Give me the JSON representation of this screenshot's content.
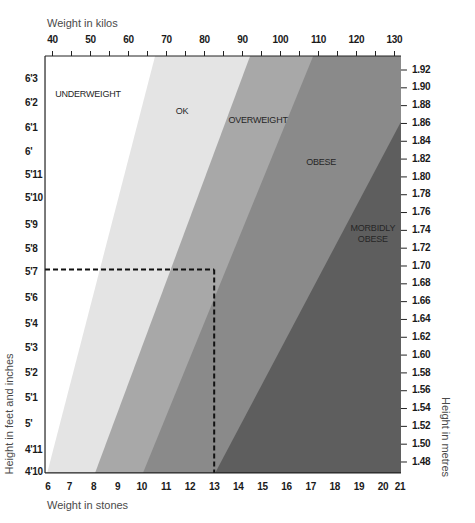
{
  "chart_data": {
    "type": "area",
    "title": "",
    "subtitle": "",
    "grid": false,
    "legend": "none (zone names printed inside the regions)",
    "x_top": {
      "label": "Weight in kilos",
      "unit": "kg",
      "ticks": [
        40,
        50,
        60,
        70,
        80,
        90,
        100,
        110,
        120,
        130
      ],
      "minor_ticks": [
        45,
        55,
        65,
        75,
        85,
        95,
        105,
        115,
        125
      ]
    },
    "x_bottom": {
      "label": "Weight in stones",
      "unit": "st",
      "ticks": [
        6,
        7,
        8,
        9,
        10,
        11,
        12,
        13,
        14,
        15,
        16,
        17,
        18,
        19,
        20,
        21
      ],
      "kg_per_stone": 6.35
    },
    "y_left": {
      "label": "Height in feet and inches",
      "ticks": [
        {
          "label": "6'3",
          "m": 1.91
        },
        {
          "label": "6'2",
          "m": 1.883
        },
        {
          "label": "6'1",
          "m": 1.855
        },
        {
          "label": "6'",
          "m": 1.828
        },
        {
          "label": "5'11",
          "m": 1.802
        },
        {
          "label": "5'10",
          "m": 1.776
        },
        {
          "label": "5'9",
          "m": 1.746
        },
        {
          "label": "5'8",
          "m": 1.719
        },
        {
          "label": "5'7",
          "m": 1.693
        },
        {
          "label": "5'6",
          "m": 1.664
        },
        {
          "label": "5'4",
          "m": 1.635
        },
        {
          "label": "5'3",
          "m": 1.607
        },
        {
          "label": "5'2",
          "m": 1.58
        },
        {
          "label": "5'1",
          "m": 1.551
        },
        {
          "label": "5'",
          "m": 1.522
        },
        {
          "label": "4'11",
          "m": 1.493
        },
        {
          "label": "4'10",
          "m": 1.468
        }
      ]
    },
    "y_right": {
      "label": "Height in metres",
      "unit": "m",
      "ticks": [
        "1.92",
        "1.90",
        "1.88",
        "1.86",
        "1.84",
        "1.82",
        "1.80",
        "1.78",
        "1.76",
        "1.74",
        "1.72",
        "1.70",
        "1.68",
        "1.66",
        "1.64",
        "1.62",
        "1.60",
        "1.58",
        "1.56",
        "1.54",
        "1.52",
        "1.50",
        "1.48"
      ]
    },
    "xlim_kg": [
      38.03,
      131.7
    ],
    "ylim_m": [
      1.4677,
      1.9357
    ],
    "zones": [
      {
        "name": "UNDERWEIGHT",
        "label_lines": [
          "UNDERWEIGHT"
        ],
        "color": "#ffffff",
        "label_kg": 40.7,
        "label_m": 1.892,
        "anchor": "start"
      },
      {
        "name": "OK",
        "label_lines": [
          "OK"
        ],
        "color": "#e4e4e4",
        "boundary_left": [
          [
            38.6,
            1.4677
          ],
          [
            67.0,
            1.9357
          ]
        ],
        "label_kg": 74.1,
        "label_m": 1.873,
        "anchor": "middle"
      },
      {
        "name": "OVERWEIGHT",
        "label_lines": [
          "OVERWEIGHT"
        ],
        "color": "#a8a8a8",
        "boundary_left": [
          [
            51.2,
            1.4677
          ],
          [
            92.0,
            1.9357
          ]
        ],
        "label_kg": 94.1,
        "label_m": 1.863,
        "anchor": "middle"
      },
      {
        "name": "OBESE",
        "label_lines": [
          "OBESE"
        ],
        "color": "#8a8a8a",
        "boundary_left": [
          [
            63.8,
            1.4677
          ],
          [
            108.6,
            1.9357
          ]
        ],
        "label_kg": 110.7,
        "label_m": 1.816,
        "anchor": "middle"
      },
      {
        "name": "MORBIDLY OBESE",
        "label_lines": [
          "MORBIDLY",
          "OBESE"
        ],
        "color": "#5e5e5e",
        "boundary_left": [
          [
            82.8,
            1.4677
          ],
          [
            131.7,
            1.862
          ]
        ],
        "label_kg": 124.3,
        "label_m": 1.742,
        "anchor": "middle"
      }
    ],
    "example_marker": {
      "style": "dashed",
      "color": "#111111",
      "weight_stones": 13,
      "weight_kg": 82.55,
      "height_ft_in": "5'7",
      "height_m": 1.696
    }
  }
}
